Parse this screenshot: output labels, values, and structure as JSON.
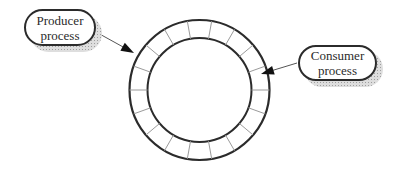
{
  "diagram": {
    "ring": {
      "slot_count": 18
    },
    "nodes": [
      {
        "id": "producer",
        "lines": [
          "Producer",
          "process"
        ]
      },
      {
        "id": "consumer",
        "lines": [
          "Consumer",
          "process"
        ]
      }
    ],
    "colors": {
      "ink": "#2b2b2b",
      "slot_divider": "#9a9a9a",
      "arrow_line": "#555555",
      "arrow_head": "#111111",
      "shadow": "#dedede",
      "background": "#ffffff"
    }
  }
}
